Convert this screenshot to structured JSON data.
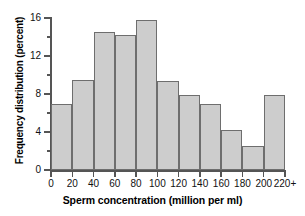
{
  "chart_data": {
    "type": "bar",
    "title": "",
    "subtitle": "",
    "xlabel": "Sperm concentration (million per ml)",
    "ylabel": "Frequency distribution (percent)",
    "categories": [
      "0-20",
      "20-40",
      "40-60",
      "60-80",
      "80-100",
      "100-120",
      "120-140",
      "140-160",
      "160-180",
      "180-200",
      "200-220+"
    ],
    "bin_edges": [
      0,
      20,
      40,
      60,
      80,
      100,
      120,
      140,
      160,
      180,
      200,
      220
    ],
    "values": [
      7.0,
      9.5,
      14.5,
      14.2,
      15.8,
      9.4,
      7.9,
      7.0,
      4.2,
      2.5,
      7.9
    ],
    "xlim": [
      0,
      220
    ],
    "ylim": [
      0,
      16
    ],
    "xticks": [
      0,
      20,
      40,
      60,
      80,
      100,
      120,
      140,
      160,
      180,
      200,
      220
    ],
    "xtick_labels": [
      "0",
      "20",
      "40",
      "60",
      "80",
      "100",
      "120",
      "140",
      "160",
      "180",
      "200",
      "220+"
    ],
    "yticks": [
      0,
      4,
      8,
      12,
      16
    ],
    "ytick_labels": [
      "0",
      "4",
      "8",
      "12",
      "16"
    ],
    "yticks_minor": [
      2,
      6,
      10,
      14
    ],
    "grid": false,
    "legend": null,
    "bar_fill_color": "#cdcdcd",
    "bar_edge_color": "#6e6e6e",
    "axis_color": "#555555",
    "background_color": "#ffffff"
  }
}
